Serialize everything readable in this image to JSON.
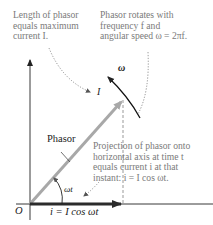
{
  "annotations": {
    "length_note": [
      "Length of phasor",
      "equals maximum",
      "current I."
    ],
    "rotation_note": [
      "Phasor rotates with",
      "frequency f and",
      "angular speed ω = 2πf."
    ],
    "projection_note": [
      "Projection of phasor onto",
      "horizontal axis at time t",
      "equals current i at that",
      "instant: i = I cos ωt."
    ]
  },
  "labels": {
    "phasor": "Phasor",
    "magnitude": "I",
    "omega": "ω",
    "angle": "ωt",
    "origin": "O",
    "current": "i = I cos ωt"
  },
  "colors": {
    "phasor": "#a8a8a8",
    "axes": "#222222",
    "current_arrow": "#2b2b2b",
    "note_text": "#7a7a7a",
    "label_text": "#1a1a1a"
  }
}
